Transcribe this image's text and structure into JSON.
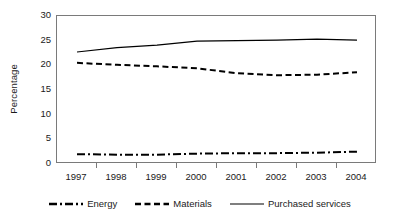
{
  "chart_data": {
    "type": "line",
    "title": "",
    "xlabel": "",
    "ylabel": "Percentage",
    "categories": [
      "1997",
      "1998",
      "1999",
      "2000",
      "2001",
      "2002",
      "2003",
      "2004"
    ],
    "ylim": [
      0,
      30
    ],
    "yticks": [
      0,
      5,
      10,
      15,
      20,
      25,
      30
    ],
    "grid": false,
    "legend_position": "bottom",
    "series": [
      {
        "name": "Energy",
        "style": "dash-dot",
        "color": "#000000",
        "values": [
          2.0,
          1.9,
          1.9,
          2.1,
          2.2,
          2.2,
          2.3,
          2.5
        ]
      },
      {
        "name": "Materials",
        "style": "dashed",
        "color": "#000000",
        "values": [
          20.5,
          20.1,
          19.8,
          19.4,
          18.4,
          18.0,
          18.1,
          18.6
        ]
      },
      {
        "name": "Purchased services",
        "style": "solid",
        "color": "#000000",
        "values": [
          22.7,
          23.6,
          24.1,
          24.9,
          25.0,
          25.1,
          25.3,
          25.1
        ]
      }
    ]
  },
  "axis": {
    "y_title": "Percentage",
    "y_tick_labels": [
      "30",
      "25",
      "20",
      "15",
      "10",
      "5",
      "0"
    ],
    "x_tick_labels": [
      "1997",
      "1998",
      "1999",
      "2000",
      "2001",
      "2002",
      "2003",
      "2004"
    ]
  },
  "legend": {
    "items": [
      {
        "label": "Energy",
        "swatch": "dash-dot-line-swatch"
      },
      {
        "label": "Materials",
        "swatch": "dashed-line-swatch"
      },
      {
        "label": "Purchased services",
        "swatch": "solid-line-swatch"
      }
    ]
  }
}
